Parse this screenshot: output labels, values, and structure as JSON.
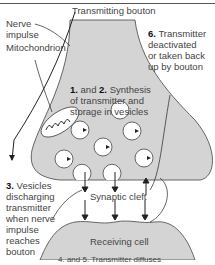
{
  "labels": {
    "transmitting_bouton": "Transmitting bouton",
    "nerve_impulse": "Nerve\nimpulse",
    "mitochondrion": "Mitochondrion",
    "step_1_2_num": "1.",
    "step_1_2_and": " and ",
    "step_1_2_num2": "2.",
    "step_1_2_text": " Synthesis\nof transmitter and\nstorage in vesicles",
    "step_6_num": "6.",
    "step_6_text": " Transmitter\ndeactivated\nor taken back\nup by bouton",
    "step_3_num": "3.",
    "step_3_text": " Vesicles\ndischarging\ntransmitter\nwhen nerve\nimpulse\nreaches\nbouton",
    "synaptic_cleft": "Synaptic cleft",
    "receiving_cell": "Receiving cell",
    "cut_off_caption": "4. and 5. Transmitter diffuses"
  },
  "colors": {
    "cell_fill": "#d4d4d4",
    "outline": "#444444",
    "vesicle_fill": "#ffffff"
  }
}
